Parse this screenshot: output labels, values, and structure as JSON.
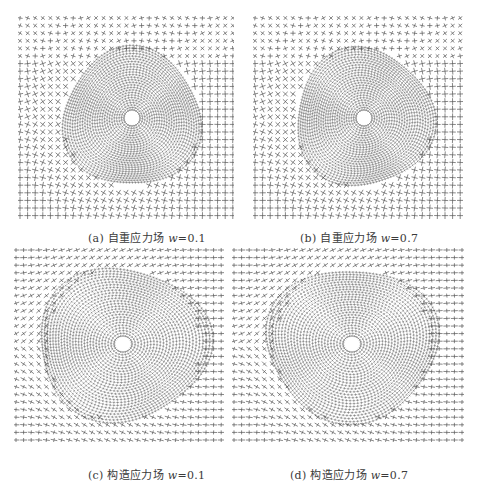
{
  "figure": {
    "panels": [
      {
        "id": "a",
        "label": "(a)",
        "title": "自重应力场",
        "variable": "w",
        "value_text": "=0.1",
        "field_type": "gravity",
        "w": 0.1,
        "box": {
          "x": 18,
          "y": 16,
          "w": 216,
          "h": 208
        },
        "caption_pos": {
          "x": 88,
          "y": 229
        }
      },
      {
        "id": "b",
        "label": "(b)",
        "title": "自重应力场",
        "variable": "w",
        "value_text": "=0.7",
        "field_type": "gravity",
        "w": 0.7,
        "box": {
          "x": 253,
          "y": 16,
          "w": 210,
          "h": 208
        },
        "caption_pos": {
          "x": 300,
          "y": 229
        }
      },
      {
        "id": "c",
        "label": "(c)",
        "title": "构造应力场",
        "variable": "w",
        "value_text": "=0.1",
        "field_type": "tectonic",
        "w": 0.1,
        "box": {
          "x": 14,
          "y": 248,
          "w": 210,
          "h": 200
        },
        "caption_pos": {
          "x": 88,
          "y": 466
        }
      },
      {
        "id": "d",
        "label": "(d)",
        "title": "构造应力场",
        "variable": "w",
        "value_text": "=0.7",
        "field_type": "tectonic",
        "w": 0.7,
        "box": {
          "x": 232,
          "y": 248,
          "w": 232,
          "h": 200
        },
        "caption_pos": {
          "x": 290,
          "y": 466
        }
      }
    ],
    "style": {
      "stroke_color": "#555555",
      "hole_color": "#ffffff",
      "grid_spacing": 7.6,
      "hole_radius": 7
    }
  }
}
